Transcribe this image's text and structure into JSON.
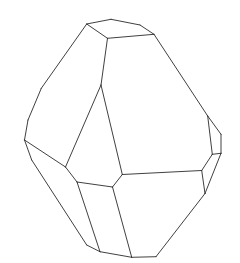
{
  "figure": {
    "type": "crystal-line-drawing",
    "stroke_color": "#2a2a2a",
    "background": "#ffffff",
    "vertices": {
      "A": [
        86.7,
        24
      ],
      "B": [
        111,
        19.3
      ],
      "C": [
        140,
        25
      ],
      "D": [
        154,
        34.3
      ],
      "E": [
        107.5,
        38.3
      ],
      "F": [
        41.3,
        88.3
      ],
      "G": [
        28,
        120
      ],
      "H": [
        24.5,
        140
      ],
      "I": [
        101,
        85
      ],
      "J": [
        65.5,
        167
      ],
      "K": [
        31.7,
        160
      ],
      "L": [
        77,
        182
      ],
      "M": [
        112.5,
        187
      ],
      "N": [
        122.3,
        174.5
      ],
      "O": [
        201.7,
        170.5
      ],
      "P": [
        207.7,
        116
      ],
      "Q": [
        221,
        134.3
      ],
      "R": [
        221,
        153.3
      ],
      "S": [
        212.3,
        154.3
      ],
      "T": [
        205,
        193.5
      ],
      "U": [
        86.7,
        245
      ],
      "V": [
        100,
        251.7
      ],
      "W": [
        131.7,
        257.3
      ],
      "X": [
        156,
        256.7
      ]
    },
    "edges": [
      [
        "A",
        "B"
      ],
      [
        "B",
        "C"
      ],
      [
        "C",
        "D"
      ],
      [
        "A",
        "E"
      ],
      [
        "E",
        "D"
      ],
      [
        "A",
        "F"
      ],
      [
        "F",
        "G"
      ],
      [
        "G",
        "H"
      ],
      [
        "E",
        "I"
      ],
      [
        "I",
        "J"
      ],
      [
        "I",
        "N"
      ],
      [
        "H",
        "J"
      ],
      [
        "J",
        "L"
      ],
      [
        "H",
        "K"
      ],
      [
        "K",
        "U"
      ],
      [
        "U",
        "V"
      ],
      [
        "V",
        "W"
      ],
      [
        "W",
        "X"
      ],
      [
        "X",
        "T"
      ],
      [
        "L",
        "M"
      ],
      [
        "M",
        "N"
      ],
      [
        "N",
        "O"
      ],
      [
        "L",
        "V"
      ],
      [
        "M",
        "W"
      ],
      [
        "D",
        "P"
      ],
      [
        "P",
        "Q"
      ],
      [
        "Q",
        "R"
      ],
      [
        "R",
        "S"
      ],
      [
        "S",
        "P"
      ],
      [
        "S",
        "O"
      ],
      [
        "O",
        "T"
      ],
      [
        "R",
        "T"
      ]
    ]
  }
}
